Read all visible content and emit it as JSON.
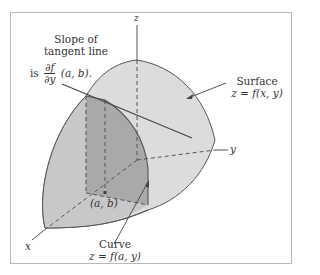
{
  "figure": {
    "axes": {
      "x_label": "x",
      "y_label": "y",
      "z_label": "z"
    },
    "slope_annotation": {
      "line1": "Slope of",
      "line2": "tangent line",
      "prefix": "is",
      "frac_num": "∂f",
      "frac_den": "∂y",
      "suffix": "(a, b)."
    },
    "surface_annotation": {
      "line1": "Surface",
      "line2": "z = f(x, y)"
    },
    "curve_annotation": {
      "line1": "Curve",
      "line2": "z = f(a, y)"
    },
    "point_label": "(a, b)",
    "colors": {
      "surface_fill": "#dcdcdc",
      "slice_fill": "#a9a9a9",
      "lower_face_fill": "#c6c6c6",
      "stroke": "#555555",
      "frame_border": "#b8b8b8"
    }
  }
}
